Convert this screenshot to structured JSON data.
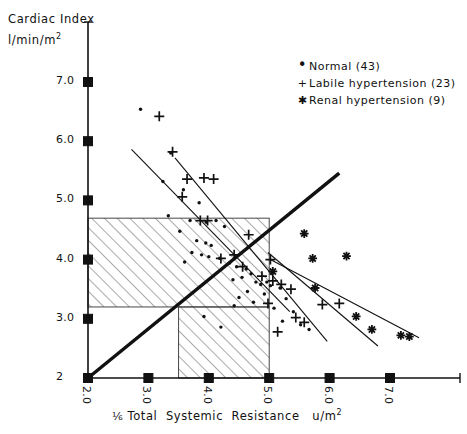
{
  "chart_data": {
    "type": "scatter",
    "title": "",
    "xlabel": "1/5 Total Systemic Resistance  u/m2",
    "ylabel_line1": "Cardiac Index",
    "ylabel_line2": "l/min/m2",
    "xlim": [
      2.0,
      7.6
    ],
    "ylim": [
      2.0,
      7.3
    ],
    "xticks": [
      "2.0",
      "3.0",
      "4.0",
      "5.0",
      "6.0",
      "7.0"
    ],
    "xtick_values": [
      2.0,
      3.0,
      4.0,
      5.0,
      6.0,
      7.0
    ],
    "yticks": [
      "7.0",
      "6.0",
      "5.0",
      "4.0",
      "3.0",
      "2"
    ],
    "ytick_values": [
      7.0,
      6.0,
      5.0,
      4.0,
      3.0,
      2.0
    ],
    "grid": false,
    "legend_position": "top-right",
    "legend": [
      {
        "marker": "dot",
        "glyph": "•",
        "label": "Normal  (43)",
        "count": 43
      },
      {
        "marker": "plus",
        "glyph": "+",
        "label": "Labile  hypertension (23)",
        "count": 23
      },
      {
        "marker": "asterisk",
        "glyph": "✱",
        "label": "Renal  hypertension (9)",
        "count": 9
      }
    ],
    "series": [
      {
        "name": "Normal",
        "marker": "dot",
        "n": 43,
        "points": [
          [
            2.87,
            6.54
          ],
          [
            3.37,
            5.8
          ],
          [
            3.24,
            5.32
          ],
          [
            3.58,
            5.18
          ],
          [
            3.84,
            4.96
          ],
          [
            3.33,
            4.74
          ],
          [
            3.69,
            4.66
          ],
          [
            3.96,
            4.63
          ],
          [
            4.12,
            4.66
          ],
          [
            4.26,
            4.56
          ],
          [
            3.52,
            4.48
          ],
          [
            3.8,
            4.32
          ],
          [
            3.95,
            4.28
          ],
          [
            4.04,
            4.24
          ],
          [
            3.72,
            4.12
          ],
          [
            3.88,
            4.08
          ],
          [
            4.0,
            4.05
          ],
          [
            4.18,
            4.02
          ],
          [
            3.6,
            3.96
          ],
          [
            4.34,
            3.94
          ],
          [
            4.46,
            3.88
          ],
          [
            4.62,
            3.84
          ],
          [
            4.7,
            3.76
          ],
          [
            4.55,
            3.7
          ],
          [
            4.4,
            3.66
          ],
          [
            4.78,
            3.62
          ],
          [
            4.86,
            3.58
          ],
          [
            5.02,
            3.56
          ],
          [
            5.18,
            3.52
          ],
          [
            4.64,
            3.46
          ],
          [
            4.92,
            3.42
          ],
          [
            4.5,
            3.36
          ],
          [
            5.28,
            3.34
          ],
          [
            4.74,
            3.28
          ],
          [
            4.42,
            3.22
          ],
          [
            5.08,
            3.18
          ],
          [
            5.4,
            3.12
          ],
          [
            3.92,
            3.04
          ],
          [
            5.22,
            2.96
          ],
          [
            5.52,
            2.9
          ],
          [
            4.2,
            2.86
          ],
          [
            5.66,
            2.82
          ],
          [
            4.96,
            3.62
          ]
        ]
      },
      {
        "name": "Labile hypertension",
        "marker": "plus",
        "n": 23,
        "points": [
          [
            3.18,
            6.42
          ],
          [
            3.4,
            5.82
          ],
          [
            3.64,
            5.36
          ],
          [
            3.56,
            5.06
          ],
          [
            3.92,
            5.38
          ],
          [
            4.08,
            5.36
          ],
          [
            3.86,
            4.66
          ],
          [
            3.98,
            4.66
          ],
          [
            4.66,
            4.42
          ],
          [
            4.42,
            4.08
          ],
          [
            4.2,
            4.02
          ],
          [
            4.56,
            3.88
          ],
          [
            5.02,
            4.0
          ],
          [
            4.88,
            3.72
          ],
          [
            5.06,
            3.64
          ],
          [
            5.2,
            3.58
          ],
          [
            5.36,
            3.5
          ],
          [
            4.98,
            3.26
          ],
          [
            5.44,
            3.02
          ],
          [
            5.58,
            2.94
          ],
          [
            5.88,
            3.24
          ],
          [
            6.16,
            3.26
          ],
          [
            5.14,
            2.78
          ]
        ]
      },
      {
        "name": "Renal hypertension",
        "marker": "asterisk",
        "n": 9,
        "points": [
          [
            5.58,
            4.44
          ],
          [
            5.72,
            4.02
          ],
          [
            6.28,
            4.06
          ],
          [
            5.06,
            3.8
          ],
          [
            5.76,
            3.52
          ],
          [
            6.44,
            3.04
          ],
          [
            6.7,
            2.82
          ],
          [
            7.18,
            2.72
          ],
          [
            7.32,
            2.7
          ]
        ]
      }
    ],
    "reference_lines": [
      {
        "name": "identity-line",
        "style": "thick",
        "x1": 2.0,
        "y1": 2.0,
        "x2": 6.16,
        "y2": 5.46
      },
      {
        "name": "normal-upper-regression",
        "style": "thin",
        "x1": 2.72,
        "y1": 5.86,
        "x2": 5.34,
        "y2": 3.12
      },
      {
        "name": "normal-lower-regression",
        "style": "thin",
        "x1": 3.44,
        "y1": 5.72,
        "x2": 5.96,
        "y2": 2.62
      },
      {
        "name": "labile-regression",
        "style": "thin",
        "x1": 4.98,
        "y1": 4.12,
        "x2": 6.8,
        "y2": 2.54
      },
      {
        "name": "renal-regression",
        "style": "thin",
        "x1": 5.02,
        "y1": 4.0,
        "x2": 7.48,
        "y2": 2.68
      }
    ],
    "hatched_regions": [
      {
        "name": "upper-normal-range-box",
        "x1": 2.0,
        "x2": 5.0,
        "y1": 3.2,
        "y2": 4.7
      },
      {
        "name": "lower-normal-range-box",
        "x1": 3.5,
        "x2": 5.0,
        "y1": 2.0,
        "y2": 3.2
      }
    ]
  }
}
